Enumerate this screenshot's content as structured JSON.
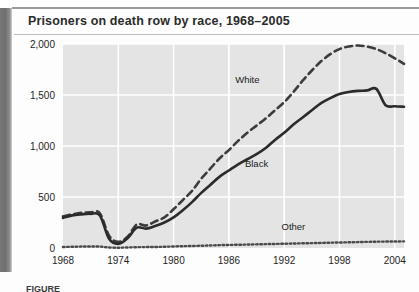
{
  "page": {
    "title": "Prisoners on death row by race, 1968–2005",
    "caption": "FIGURE"
  },
  "chart_data": {
    "type": "line",
    "title": "Prisoners on death row by race, 1968–2005",
    "xlabel": "",
    "ylabel": "",
    "xlim": [
      1968,
      2005
    ],
    "ylim": [
      0,
      2000
    ],
    "yticks": [
      0,
      500,
      1000,
      1500,
      2000
    ],
    "ytick_labels": [
      "0",
      "500",
      "1,000",
      "1,500",
      "2,000"
    ],
    "xticks": [
      1968,
      1974,
      1980,
      1986,
      1992,
      1998,
      2004
    ],
    "xtick_labels": [
      "1968",
      "1974",
      "1980",
      "1986",
      "1992",
      "1998",
      "2004"
    ],
    "grid": true,
    "legend": "inline-labels",
    "plot_background": "#e4e4e4",
    "gridline_color": "#ffffff",
    "series": [
      {
        "name": "White",
        "style": "dashed",
        "color": "#3c3c3c",
        "label_x": 1988,
        "label_y": 1620,
        "x": [
          1968,
          1969,
          1970,
          1971,
          1972,
          1973,
          1974,
          1975,
          1976,
          1977,
          1978,
          1979,
          1980,
          1981,
          1982,
          1983,
          1984,
          1985,
          1986,
          1987,
          1988,
          1989,
          1990,
          1991,
          1992,
          1993,
          1994,
          1995,
          1996,
          1997,
          1998,
          1999,
          2000,
          2001,
          2002,
          2003,
          2004,
          2005
        ],
        "values": [
          310,
          330,
          345,
          350,
          340,
          120,
          60,
          110,
          230,
          220,
          260,
          300,
          380,
          470,
          560,
          680,
          780,
          880,
          960,
          1050,
          1130,
          1200,
          1270,
          1350,
          1430,
          1530,
          1640,
          1740,
          1830,
          1900,
          1950,
          1975,
          1985,
          1975,
          1950,
          1910,
          1860,
          1805
        ]
      },
      {
        "name": "Black",
        "style": "solid",
        "color": "#2b2b2b",
        "label_x": 1989,
        "label_y": 790,
        "x": [
          1968,
          1969,
          1970,
          1971,
          1972,
          1973,
          1974,
          1975,
          1976,
          1977,
          1978,
          1979,
          1980,
          1981,
          1982,
          1983,
          1984,
          1985,
          1986,
          1987,
          1988,
          1989,
          1990,
          1991,
          1992,
          1993,
          1994,
          1995,
          1996,
          1997,
          1998,
          1999,
          2000,
          2001,
          2002,
          2003,
          2004,
          2005
        ],
        "values": [
          295,
          320,
          330,
          335,
          320,
          90,
          40,
          95,
          200,
          190,
          215,
          250,
          300,
          370,
          450,
          540,
          620,
          700,
          760,
          820,
          870,
          920,
          980,
          1060,
          1130,
          1210,
          1280,
          1350,
          1420,
          1470,
          1510,
          1530,
          1540,
          1545,
          1560,
          1400,
          1390,
          1385
        ]
      },
      {
        "name": "Other",
        "style": "dotted",
        "color": "#4a4a4a",
        "label_x": 1993,
        "label_y": 175,
        "x": [
          1968,
          1969,
          1970,
          1971,
          1972,
          1973,
          1974,
          1975,
          1976,
          1977,
          1978,
          1979,
          1980,
          1981,
          1982,
          1983,
          1984,
          1985,
          1986,
          1987,
          1988,
          1989,
          1990,
          1991,
          1992,
          1993,
          1994,
          1995,
          1996,
          1997,
          1998,
          1999,
          2000,
          2001,
          2002,
          2003,
          2004,
          2005
        ],
        "values": [
          10,
          12,
          14,
          15,
          14,
          5,
          3,
          5,
          8,
          9,
          10,
          12,
          15,
          18,
          20,
          22,
          25,
          28,
          30,
          32,
          34,
          36,
          38,
          40,
          42,
          44,
          46,
          48,
          50,
          52,
          54,
          56,
          58,
          60,
          62,
          63,
          64,
          65
        ]
      }
    ]
  }
}
